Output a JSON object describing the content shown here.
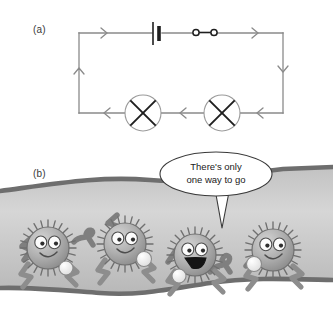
{
  "figure": {
    "panels": [
      {
        "id": "a",
        "label": "(a)",
        "type": "circuit-diagram",
        "components": [
          {
            "name": "battery",
            "symbol": "cell",
            "position": "top-wire"
          },
          {
            "name": "switch",
            "symbol": "closed-switch",
            "position": "top-wire"
          },
          {
            "name": "lamp-left",
            "symbol": "lamp-crossed-circle",
            "position": "bottom-wire"
          },
          {
            "name": "lamp-right",
            "symbol": "lamp-crossed-circle",
            "position": "bottom-wire"
          }
        ],
        "current_arrows": [
          {
            "position": "top-left",
            "direction": "right"
          },
          {
            "position": "top-right",
            "direction": "right"
          },
          {
            "position": "left-wire",
            "direction": "up"
          },
          {
            "position": "right-wire",
            "direction": "down"
          },
          {
            "position": "bottom-left",
            "direction": "left"
          },
          {
            "position": "bottom-middle",
            "direction": "left"
          },
          {
            "position": "bottom-right",
            "direction": "left"
          }
        ]
      },
      {
        "id": "b",
        "label": "(b)",
        "type": "cartoon-illustration",
        "speech_bubble": {
          "line1": "There's only",
          "line2": "one way to go"
        },
        "characters": [
          {
            "id": 1,
            "mouth": "smile",
            "holds": "charge-ball"
          },
          {
            "id": 2,
            "mouth": "smile",
            "holds": "charge-ball"
          },
          {
            "id": 3,
            "mouth": "open",
            "holds": "charge-ball",
            "speaking": true
          },
          {
            "id": 4,
            "mouth": "smile",
            "holds": "charge-ball"
          }
        ],
        "scene": "electrons moving single-file through a wire"
      }
    ],
    "colors": {
      "wire_line": "#8a8a8a",
      "component_outline": "#2b2b2b",
      "pipe_fill": "#c9c9c9",
      "pipe_border": "#6e6e6e",
      "character_body": "#a9a9a9",
      "background": "#ffffff",
      "text": "#1a1a1a"
    }
  }
}
